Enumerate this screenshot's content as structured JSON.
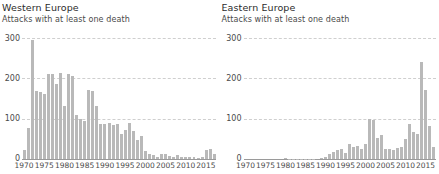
{
  "chart_data": [
    {
      "type": "bar",
      "title": "Western Europe",
      "subtitle": "Attacks with at least one death",
      "xlabel": "",
      "ylabel": "",
      "ylim": [
        0,
        300
      ],
      "yticks": [
        0,
        100,
        200,
        300
      ],
      "ytick_labels": [
        "0",
        "100",
        "200",
        "300"
      ],
      "xlim": [
        1970,
        2017
      ],
      "xticks": [
        1970,
        1975,
        1980,
        1985,
        1990,
        1995,
        2000,
        2005,
        2010,
        2015
      ],
      "xtick_labels": [
        "1970",
        "1975",
        "1980",
        "1985",
        "1990",
        "1995",
        "2000",
        "2005",
        "2010",
        "2015"
      ],
      "grid": true,
      "legend": "none",
      "bar_color": "#b9b9b9",
      "categories": [
        1970,
        1971,
        1972,
        1973,
        1974,
        1975,
        1976,
        1977,
        1978,
        1979,
        1980,
        1981,
        1982,
        1983,
        1984,
        1985,
        1986,
        1987,
        1988,
        1989,
        1990,
        1991,
        1992,
        1993,
        1994,
        1995,
        1996,
        1997,
        1998,
        1999,
        2000,
        2001,
        2002,
        2003,
        2004,
        2005,
        2006,
        2007,
        2008,
        2009,
        2010,
        2011,
        2012,
        2013,
        2014,
        2015,
        2016,
        2017
      ],
      "values": [
        22,
        78,
        295,
        168,
        165,
        162,
        210,
        212,
        186,
        214,
        132,
        212,
        206,
        110,
        98,
        95,
        170,
        168,
        132,
        88,
        88,
        90,
        85,
        88,
        62,
        72,
        90,
        70,
        48,
        58,
        20,
        12,
        10,
        6,
        12,
        12,
        7,
        5,
        9,
        5,
        4,
        6,
        4,
        3,
        4,
        22,
        26,
        12
      ]
    },
    {
      "type": "bar",
      "title": "Eastern Europe",
      "subtitle": "Attacks with at least one death",
      "xlabel": "",
      "ylabel": "",
      "ylim": [
        0,
        300
      ],
      "yticks": [
        0,
        100,
        200,
        300
      ],
      "ytick_labels": [
        "0",
        "100",
        "200",
        "300"
      ],
      "xlim": [
        1970,
        2017
      ],
      "xticks": [
        1970,
        1975,
        1980,
        1985,
        1990,
        1995,
        2000,
        2005,
        2010,
        2015
      ],
      "xtick_labels": [
        "1970",
        "1975",
        "1980",
        "1985",
        "1990",
        "1995",
        "2000",
        "2005",
        "2010",
        "2015"
      ],
      "grid": true,
      "legend": "none",
      "bar_color": "#b9b9b9",
      "categories": [
        1970,
        1971,
        1972,
        1973,
        1974,
        1975,
        1976,
        1977,
        1978,
        1979,
        1980,
        1981,
        1982,
        1983,
        1984,
        1985,
        1986,
        1987,
        1988,
        1989,
        1990,
        1991,
        1992,
        1993,
        1994,
        1995,
        1996,
        1997,
        1998,
        1999,
        2000,
        2001,
        2002,
        2003,
        2004,
        2005,
        2006,
        2007,
        2008,
        2009,
        2010,
        2011,
        2012,
        2013,
        2014,
        2015,
        2016,
        2017
      ],
      "values": [
        0,
        0,
        0,
        0,
        0,
        0,
        0,
        0,
        0,
        0,
        2,
        1,
        1,
        1,
        1,
        1,
        1,
        1,
        0,
        3,
        6,
        12,
        18,
        22,
        26,
        14,
        38,
        30,
        32,
        26,
        38,
        98,
        96,
        52,
        60,
        26,
        24,
        22,
        28,
        30,
        50,
        86,
        68,
        62,
        240,
        170,
        82,
        30
      ]
    }
  ]
}
